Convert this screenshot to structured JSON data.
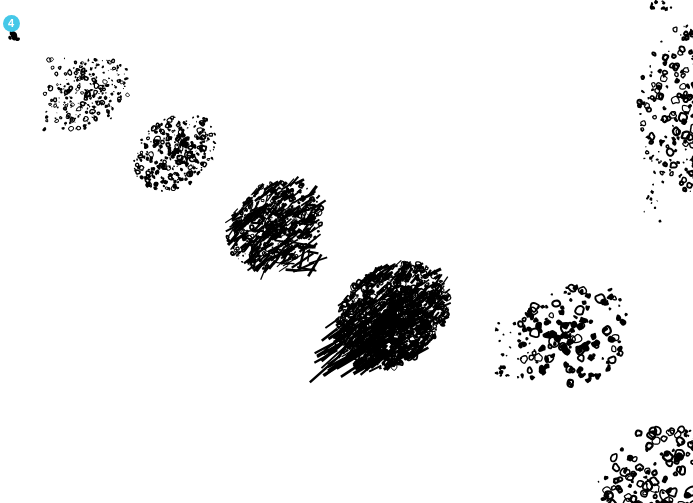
{
  "image": {
    "title": "Binarized microscopy field",
    "width": 693,
    "height": 503,
    "background_color": "#ffffff",
    "ink_color": "#000000",
    "description": "Black-and-white thresholded micrograph showing a large diagonal elongated speckled aggregate running from upper-left to center, plus three cropped oval speckled bodies at the right and bottom-right edges."
  },
  "annotations": {
    "markers": [
      {
        "id": "marker-4",
        "label": "4",
        "color": "#45c8e8",
        "text_color": "#ffffff",
        "x": 11,
        "y": 23,
        "diameter": 17,
        "font_size": 11
      }
    ]
  },
  "objects": [
    {
      "name": "primary-aggregate",
      "kind": "elongated-speckled-chain",
      "centroid_x": 250,
      "centroid_y": 215,
      "angle_deg": 38,
      "length": 420,
      "description": "Main diagonal chain of four fused lobes increasing in density toward the lower-right head."
    },
    {
      "name": "right-edge-body",
      "kind": "cropped-oval-annuli",
      "centroid_x": 678,
      "centroid_y": 105,
      "description": "Oval body with ring-like speckles, clipped by the right edge."
    },
    {
      "name": "lower-right-cluster",
      "kind": "round-dot-cluster",
      "centroid_x": 568,
      "centroid_y": 338,
      "description": "Rounded cluster of discrete filled dots."
    },
    {
      "name": "bottom-right-body",
      "kind": "cropped-oval-annuli",
      "centroid_x": 660,
      "centroid_y": 478,
      "description": "Oval body with ring speckles, clipped by the bottom-right corner."
    },
    {
      "name": "top-edge-fragment",
      "kind": "ink-fragment",
      "centroid_x": 662,
      "centroid_y": 6,
      "description": "Small dark fragment touching the top edge."
    },
    {
      "name": "corner-fragment",
      "kind": "ink-fragment",
      "centroid_x": 14,
      "centroid_y": 36,
      "description": "Small dark ink fragment below the marker badge."
    },
    {
      "name": "right-specks",
      "kind": "isolated-specks",
      "centroid_x": 660,
      "centroid_y": 200,
      "description": "A few tiny isolated specks in the right mid-field."
    }
  ]
}
